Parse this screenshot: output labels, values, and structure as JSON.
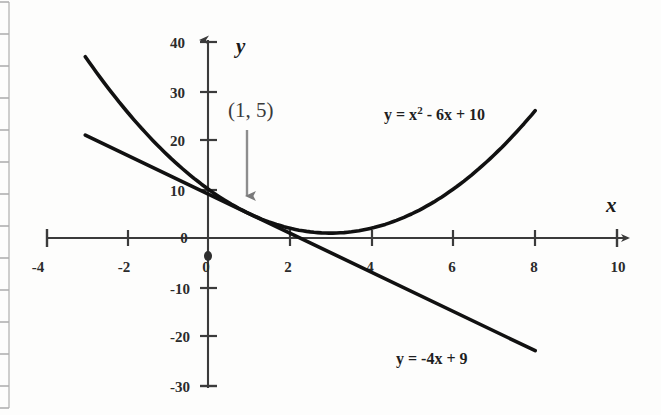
{
  "chart_data": {
    "type": "line",
    "title": "",
    "subtitle": "",
    "xlabel": "x",
    "ylabel": "y",
    "xlim": [
      -4,
      10
    ],
    "ylim": [
      -30,
      40
    ],
    "grid": false,
    "legend_position": "inline-labels",
    "x_ticks": [
      -4,
      -2,
      0,
      2,
      4,
      6,
      8,
      10
    ],
    "x_tick_labels": [
      "-4",
      "-2",
      "0",
      "2",
      "4",
      "6",
      "8",
      "10"
    ],
    "y_ticks": [
      40,
      30,
      20,
      10,
      0,
      -10,
      -20,
      -30
    ],
    "y_tick_labels": [
      "40",
      "30",
      "20",
      "10",
      "0",
      "-10",
      "-20",
      "-30"
    ],
    "origin_label": "0",
    "series": [
      {
        "name": "parabola",
        "label": "y = x² - 6x + 10",
        "label_main": "y = x",
        "label_sup": "2",
        "label_rest": " - 6x + 10",
        "kind": "quadratic",
        "a": 1,
        "b": -6,
        "c": 10,
        "x_range": [
          -3,
          8
        ],
        "vertex": [
          3,
          1
        ],
        "color": "#111111",
        "points": [
          {
            "x": -3,
            "y": 37
          },
          {
            "x": -2,
            "y": 26
          },
          {
            "x": -1,
            "y": 17
          },
          {
            "x": 0,
            "y": 10
          },
          {
            "x": 1,
            "y": 5
          },
          {
            "x": 2,
            "y": 2
          },
          {
            "x": 3,
            "y": 1
          },
          {
            "x": 4,
            "y": 2
          },
          {
            "x": 5,
            "y": 5
          },
          {
            "x": 6,
            "y": 10
          },
          {
            "x": 7,
            "y": 17
          },
          {
            "x": 8,
            "y": 26
          }
        ]
      },
      {
        "name": "line",
        "label": "y = -4x + 9",
        "kind": "linear",
        "slope": -4,
        "intercept": 9,
        "x_range": [
          -3,
          8
        ],
        "color": "#111111",
        "points": [
          {
            "x": -3,
            "y": 21
          },
          {
            "x": 0,
            "y": 9
          },
          {
            "x": 1,
            "y": 5
          },
          {
            "x": 2,
            "y": 1
          },
          {
            "x": 8,
            "y": -23
          }
        ]
      }
    ],
    "annotations": [
      {
        "name": "intersection-point",
        "text": "(1, 5)",
        "x": 1,
        "y": 5,
        "arrow": "down",
        "color": "#6e6e6e"
      }
    ]
  },
  "labels": {
    "x_axis": "x",
    "y_axis": "y",
    "parabola_eq_main": "y = x",
    "parabola_eq_sup": "2",
    "parabola_eq_rest": " - 6x + 10",
    "line_eq": "y = -4x + 9",
    "point": "(1, 5)"
  },
  "colors": {
    "curve": "#111111",
    "axis": "#3b3b3b",
    "text": "#2b2b2b",
    "annotation": "#6e6e6e",
    "background": "#fdfdfc",
    "page_edge": "#b9b9b9"
  }
}
